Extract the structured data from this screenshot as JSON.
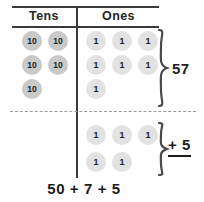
{
  "diagram": {
    "title_row": {
      "tens_label": "Tens",
      "ones_label": "Ones"
    },
    "top_group": {
      "tens_tokens": [
        {
          "value": "10"
        },
        {
          "value": "10"
        },
        {
          "value": "10"
        },
        {
          "value": "10"
        },
        {
          "value": "10"
        }
      ],
      "ones_tokens": [
        {
          "value": "1"
        },
        {
          "value": "1"
        },
        {
          "value": "1"
        },
        {
          "value": "1"
        },
        {
          "value": "1"
        },
        {
          "value": "1"
        },
        {
          "value": "1"
        }
      ],
      "brace_label": "57"
    },
    "bottom_group": {
      "tens_tokens": [],
      "ones_tokens": [
        {
          "value": "1"
        },
        {
          "value": "1"
        },
        {
          "value": "1"
        },
        {
          "value": "1"
        },
        {
          "value": "1"
        }
      ],
      "brace_label": "+ 5"
    },
    "equation": "50 + 7 + 5",
    "colors": {
      "ten_token_fill": "#c9c9c9",
      "one_token_fill": "#e2e2e2",
      "rule": "#3b3b3b",
      "dashed_rule": "#9a9a9a",
      "text": "#1d1d1d",
      "background": "#ffffff"
    }
  }
}
